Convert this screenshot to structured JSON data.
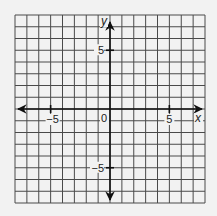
{
  "chart_data": {
    "type": "coordinate-grid",
    "title": "",
    "xlabel": "x",
    "ylabel": "y",
    "xlim": [
      -8,
      8
    ],
    "ylim": [
      -8,
      8
    ],
    "grid": true,
    "grid_step": 1,
    "x_ticks": [
      {
        "value": -5,
        "label": "−5"
      },
      {
        "value": 5,
        "label": "5"
      }
    ],
    "y_ticks": [
      {
        "value": 5,
        "label": "5"
      },
      {
        "value": -5,
        "label": "−5"
      }
    ],
    "origin_label": "0",
    "axes_arrows": true,
    "series": []
  },
  "style": {
    "background": "#f2f2f2",
    "grid_color": "#4a4a4a",
    "axis_color": "#111111"
  },
  "labels": {
    "x_axis": "x",
    "y_axis": "y",
    "origin": "0",
    "x_neg5": "−5",
    "x_pos5": "5",
    "y_pos5": "5",
    "y_neg5": "−5"
  }
}
